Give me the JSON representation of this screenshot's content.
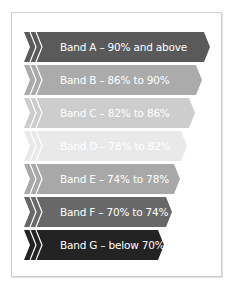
{
  "diagram": {
    "type": "chevron-band-list",
    "bands": [
      {
        "label": "Band A – 90% and above",
        "color": "#5a5a5a",
        "top": 32,
        "width": 186
      },
      {
        "label": "Band B – 86% to 90%",
        "color": "#ababab",
        "top": 65,
        "width": 178
      },
      {
        "label": "Band C – 82% to 86%",
        "color": "#cdcdcd",
        "top": 98,
        "width": 171
      },
      {
        "label": "Band D – 78% to 82%",
        "color": "#e9e9e9",
        "top": 131,
        "width": 163
      },
      {
        "label": "Band E – 74% to 78%",
        "color": "#a8a8a8",
        "top": 164,
        "width": 156
      },
      {
        "label": "Band F – 70% to 74%",
        "color": "#686868",
        "top": 197,
        "width": 148
      },
      {
        "label": "Band G – below 70%",
        "color": "#232323",
        "top": 230,
        "width": 140
      }
    ]
  }
}
